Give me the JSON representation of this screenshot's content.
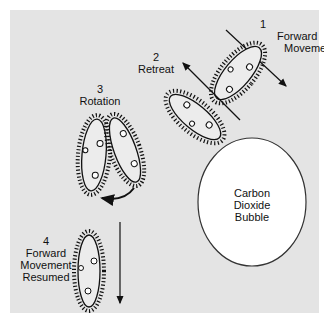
{
  "diagram": {
    "background_color": "#e4e4e4",
    "stages": [
      {
        "number": "1",
        "label_lines": [
          "Forward",
          "Movement"
        ]
      },
      {
        "number": "2",
        "label_lines": [
          "Retreat"
        ]
      },
      {
        "number": "3",
        "label_lines": [
          "Rotation"
        ]
      },
      {
        "number": "4",
        "label_lines": [
          "Forward",
          "Movement",
          "Resumed"
        ]
      }
    ],
    "obstacle": {
      "label_lines": [
        "Carbon",
        "Dioxide",
        "Bubble"
      ],
      "fill": "#ffffff",
      "stroke": "#333333"
    }
  }
}
